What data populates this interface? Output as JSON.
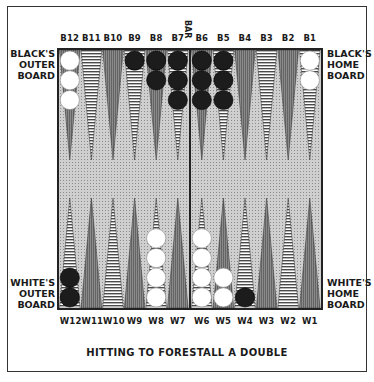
{
  "caption": "HITTING TO FORESTALL A DOUBLE",
  "bar_label": "BAR",
  "side_labels": {
    "black_outer": [
      "BLACK'S",
      "OUTER",
      "BOARD"
    ],
    "black_home": [
      "BLACK'S",
      "HOME",
      "BOARD"
    ],
    "white_outer": [
      "WHITE'S",
      "OUTER",
      "BOARD"
    ],
    "white_home": [
      "WHITE'S",
      "HOME",
      "BOARD"
    ]
  },
  "top_points": [
    "B12",
    "B11",
    "B10",
    "B9",
    "B8",
    "B7",
    "B6",
    "B5",
    "B4",
    "B3",
    "B2",
    "B1"
  ],
  "bottom_points": [
    "W12",
    "W11",
    "W10",
    "W9",
    "W8",
    "W7",
    "W6",
    "W5",
    "W4",
    "W3",
    "W2",
    "W1"
  ],
  "colors": {
    "black_checker": "#1c1c1c",
    "white_checker": "#ffffff",
    "dark_point": "#7a7a7a",
    "board_bg": "#cfcfcf",
    "frame": "#333333"
  },
  "position": {
    "top": [
      {
        "point": "B12",
        "color": "white",
        "count": 3
      },
      {
        "point": "B11",
        "color": null,
        "count": 0
      },
      {
        "point": "B10",
        "color": null,
        "count": 0
      },
      {
        "point": "B9",
        "color": "black",
        "count": 1
      },
      {
        "point": "B8",
        "color": "black",
        "count": 2
      },
      {
        "point": "B7",
        "color": "black",
        "count": 3
      },
      {
        "point": "B6",
        "color": "black",
        "count": 3
      },
      {
        "point": "B5",
        "color": "black",
        "count": 3
      },
      {
        "point": "B4",
        "color": null,
        "count": 0
      },
      {
        "point": "B3",
        "color": null,
        "count": 0
      },
      {
        "point": "B2",
        "color": null,
        "count": 0
      },
      {
        "point": "B1",
        "color": "white",
        "count": 2
      }
    ],
    "bottom": [
      {
        "point": "W12",
        "color": "black",
        "count": 2
      },
      {
        "point": "W11",
        "color": null,
        "count": 0
      },
      {
        "point": "W10",
        "color": null,
        "count": 0
      },
      {
        "point": "W9",
        "color": null,
        "count": 0
      },
      {
        "point": "W8",
        "color": "white",
        "count": 4
      },
      {
        "point": "W7",
        "color": null,
        "count": 0
      },
      {
        "point": "W6",
        "color": "white",
        "count": 4
      },
      {
        "point": "W5",
        "color": "white",
        "count": 2
      },
      {
        "point": "W4",
        "color": "black",
        "count": 1
      },
      {
        "point": "W3",
        "color": null,
        "count": 0
      },
      {
        "point": "W2",
        "color": null,
        "count": 0
      },
      {
        "point": "W1",
        "color": null,
        "count": 0
      }
    ]
  }
}
